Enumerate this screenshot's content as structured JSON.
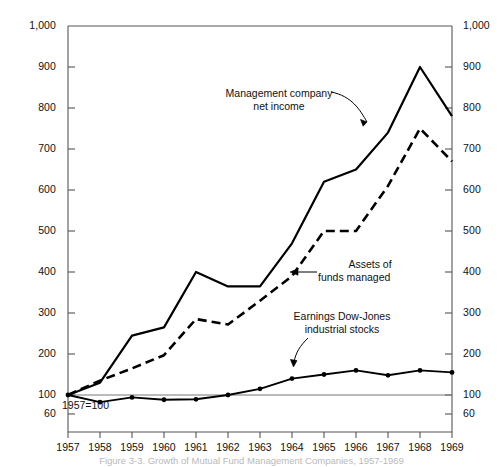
{
  "chart_data": {
    "type": "line",
    "title": "",
    "caption": "Figure 3-3. Growth of Mutual Fund Management Companies, 1957-1969",
    "xlabel": "",
    "ylabel": "",
    "base_note": "1957=100",
    "x": [
      1957,
      1958,
      1959,
      1960,
      1961,
      1962,
      1963,
      1964,
      1965,
      1966,
      1967,
      1968,
      1969
    ],
    "xtick_labels": [
      "1957",
      "1958",
      "1959",
      "1960",
      "1961",
      "1962",
      "1963",
      "1964",
      "1965",
      "1966",
      "1967",
      "1968",
      "1969"
    ],
    "ytick_labels_left": [
      "1,000",
      "900",
      "800",
      "700",
      "600",
      "500",
      "400",
      "300",
      "200",
      "100",
      "60"
    ],
    "ytick_labels_right": [
      "1,000",
      "900",
      "800",
      "700",
      "600",
      "500",
      "400",
      "300",
      "200",
      "100",
      "60"
    ],
    "yticks": [
      1000,
      900,
      800,
      700,
      600,
      500,
      400,
      300,
      200,
      100,
      60
    ],
    "ylim": [
      60,
      1000
    ],
    "xlim": [
      1957,
      1969
    ],
    "grid": false,
    "legend_position": "inline-annotations",
    "series": [
      {
        "name": "Management company net income",
        "style": "solid",
        "markers": false,
        "label_text_line1": "Management company",
        "label_text_line2": "net income",
        "values": [
          100,
          130,
          245,
          265,
          400,
          365,
          365,
          470,
          620,
          650,
          740,
          900,
          780
        ]
      },
      {
        "name": "Assets of funds managed",
        "style": "dashed",
        "markers": false,
        "label_text_line1": "Assets of",
        "label_text_line2": "funds managed",
        "values": [
          100,
          135,
          165,
          197,
          285,
          272,
          330,
          390,
          500,
          500,
          610,
          750,
          670
        ]
      },
      {
        "name": "Earnings Dow-Jones industrial stocks",
        "style": "solid-marker",
        "markers": true,
        "label_text_line1": "Earnings Dow-Jones",
        "label_text_line2": "industrial stocks",
        "values": [
          100,
          85,
          95,
          90,
          91,
          100,
          115,
          140,
          150,
          160,
          148,
          160,
          155
        ]
      }
    ]
  },
  "colors": {
    "line": "#000000",
    "axis": "#555555",
    "baseline": "#777777",
    "text": "#111111",
    "caption": "#bbbbbb"
  }
}
